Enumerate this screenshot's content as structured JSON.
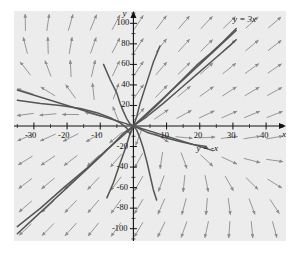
{
  "chart_data": {
    "type": "line",
    "title": "",
    "subtitle": "",
    "xlabel": "x",
    "ylabel": "y",
    "xlim": [
      -36,
      46
    ],
    "ylim": [
      -112,
      112
    ],
    "grid": false,
    "legend_position": "none",
    "background_color": "#ececec",
    "axis_color": "#111111",
    "vector_color": "#8c8c8c",
    "curve_color": "#555555",
    "x_ticks": [
      -30,
      -20,
      -10,
      10,
      20,
      30,
      40
    ],
    "x_tick_labels": [
      "-30",
      "-20",
      "-10",
      "10",
      "20",
      "30",
      "40"
    ],
    "y_ticks": [
      -100,
      -80,
      -60,
      -40,
      -20,
      20,
      40,
      60,
      80,
      100
    ],
    "y_tick_labels": [
      "-100",
      "-80",
      "-60",
      "-40",
      "-20",
      "20",
      "40",
      "60",
      "80",
      "100"
    ],
    "x_minor_tick_step": 5,
    "y_minor_tick_step": 10,
    "annotations": [
      {
        "text": "y = 3x",
        "x": 30,
        "y": 103,
        "name": "line-label-y-equals-3x"
      },
      {
        "text": "y = -x",
        "x": 19,
        "y": -22,
        "name": "line-label-y-equals-minus-x"
      }
    ],
    "series": [
      {
        "name": "y = 3x",
        "type": "line",
        "description": "straight asymptote line through origin with slope 3",
        "slope": 3,
        "intercept": 0,
        "x_range": [
          -2,
          31
        ]
      },
      {
        "name": "y = -x",
        "type": "line",
        "description": "straight asymptote line through origin with slope -1",
        "slope": -1,
        "intercept": 0,
        "x_range": [
          -35,
          24
        ]
      },
      {
        "name": "solution-curve-1",
        "type": "curve",
        "points": [
          [
            -35,
            -105
          ],
          [
            -30,
            -90
          ],
          [
            -25,
            -75
          ],
          [
            -20,
            -60
          ],
          [
            -15,
            -45
          ],
          [
            -10,
            -30
          ],
          [
            -6,
            -17
          ],
          [
            -3,
            -7
          ],
          [
            0,
            0
          ]
        ]
      },
      {
        "name": "solution-curve-2",
        "type": "curve",
        "points": [
          [
            0,
            0
          ],
          [
            3,
            8
          ],
          [
            7,
            20
          ],
          [
            11,
            33
          ],
          [
            15,
            46
          ],
          [
            19,
            59
          ],
          [
            23,
            70
          ],
          [
            27,
            82
          ],
          [
            31,
            95
          ]
        ]
      },
      {
        "name": "solution-curve-3",
        "type": "curve",
        "points": [
          [
            -35,
            -98
          ],
          [
            -28,
            -80
          ],
          [
            -21,
            -60
          ],
          [
            -14,
            -41
          ],
          [
            -8,
            -23
          ],
          [
            -3,
            -9
          ],
          [
            0,
            0
          ]
        ]
      },
      {
        "name": "solution-curve-4",
        "type": "curve",
        "points": [
          [
            0,
            0
          ],
          [
            4,
            9
          ],
          [
            9,
            22
          ],
          [
            14,
            36
          ],
          [
            19,
            50
          ],
          [
            24,
            64
          ],
          [
            29,
            78
          ],
          [
            31,
            84
          ]
        ]
      },
      {
        "name": "solution-curve-5",
        "type": "curve",
        "points": [
          [
            -8,
            -70
          ],
          [
            -6,
            -55
          ],
          [
            -4,
            -36
          ],
          [
            -2,
            -18
          ],
          [
            -1,
            -7
          ],
          [
            0,
            0
          ],
          [
            1,
            9
          ],
          [
            2,
            22
          ],
          [
            4,
            42
          ],
          [
            6,
            62
          ],
          [
            8,
            78
          ]
        ]
      },
      {
        "name": "solution-curve-6",
        "type": "curve",
        "points": [
          [
            -35,
            25
          ],
          [
            -28,
            22
          ],
          [
            -22,
            20
          ],
          [
            -16,
            17
          ],
          [
            -11,
            13
          ],
          [
            -7,
            8
          ],
          [
            -4,
            3
          ],
          [
            -2,
            -2
          ],
          [
            -1,
            -8
          ],
          [
            0,
            0
          ]
        ]
      },
      {
        "name": "solution-curve-7",
        "type": "curve",
        "points": [
          [
            -9,
            60
          ],
          [
            -7,
            45
          ],
          [
            -5,
            32
          ],
          [
            -4,
            22
          ],
          [
            -3,
            14
          ],
          [
            -2,
            7
          ],
          [
            -1,
            2
          ],
          [
            0,
            0
          ],
          [
            1,
            -4
          ],
          [
            2,
            -12
          ],
          [
            3,
            -22
          ],
          [
            4,
            -34
          ],
          [
            5,
            -48
          ],
          [
            6,
            -62
          ],
          [
            7,
            -72
          ]
        ]
      },
      {
        "name": "solution-curve-8",
        "type": "curve",
        "points": [
          [
            0,
            0
          ],
          [
            4,
            -6
          ],
          [
            9,
            -11
          ],
          [
            14,
            -15
          ],
          [
            18,
            -18
          ],
          [
            22,
            -20
          ]
        ]
      }
    ],
    "vector_field": {
      "description": "direction field arrows on a regular grid",
      "arrow_count_x": 12,
      "arrow_count_y": 10,
      "arrow_length_px": 17
    }
  },
  "figure": {
    "border_color": "#ffffff",
    "margin_color": "#ffffff"
  }
}
